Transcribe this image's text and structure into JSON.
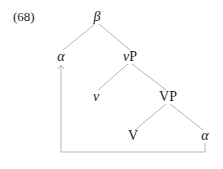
{
  "example_number": "(68)",
  "tree": {
    "nodes": [
      {
        "id": "beta",
        "label": "β",
        "italic": true
      },
      {
        "id": "alpha-moved",
        "label": "α",
        "italic": true
      },
      {
        "id": "vP",
        "label_italic_part": "v",
        "label_rest": "P"
      },
      {
        "id": "v",
        "label": "v",
        "italic": true
      },
      {
        "id": "VP",
        "label": "VP",
        "italic": false
      },
      {
        "id": "V",
        "label": "V",
        "italic": false
      },
      {
        "id": "alpha-base",
        "label": "α",
        "italic": true
      }
    ],
    "edges": [
      [
        "beta",
        "alpha-moved"
      ],
      [
        "beta",
        "vP"
      ],
      [
        "vP",
        "v"
      ],
      [
        "vP",
        "VP"
      ],
      [
        "VP",
        "V"
      ],
      [
        "VP",
        "alpha-base"
      ]
    ],
    "movement_arrow": {
      "from": "alpha-base",
      "to": "alpha-moved"
    },
    "line_color": "#b0b0b0"
  }
}
